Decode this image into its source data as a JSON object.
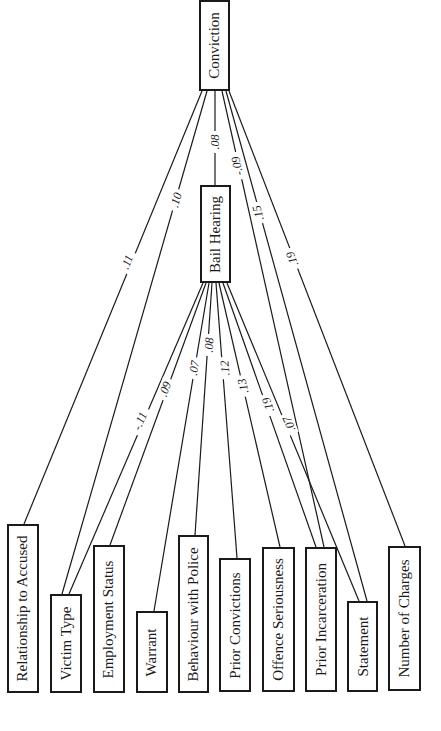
{
  "diagram": {
    "type": "path-diagram",
    "orientation": "rotated-90",
    "nodes": {
      "conviction": {
        "label": "Conviction",
        "x": 199,
        "y": 0,
        "w": 31,
        "h": 91
      },
      "bail_hearing": {
        "label": "Bail Hearing",
        "x": 200,
        "y": 185,
        "w": 31,
        "h": 98
      },
      "relationship": {
        "label": "Relationship to Accused",
        "x": 7,
        "y": 524,
        "w": 32,
        "h": 169
      },
      "victim_type": {
        "label": "Victim Type",
        "x": 50,
        "y": 594,
        "w": 32,
        "h": 99
      },
      "employment": {
        "label": "Employment Status",
        "x": 93,
        "y": 545,
        "w": 32,
        "h": 148
      },
      "warrant": {
        "label": "Warrant",
        "x": 136,
        "y": 611,
        "w": 32,
        "h": 82
      },
      "behaviour": {
        "label": "Behaviour with Police",
        "x": 178,
        "y": 535,
        "w": 31,
        "h": 158
      },
      "prior_convictions": {
        "label": "Prior Convictions",
        "x": 219,
        "y": 558,
        "w": 32,
        "h": 134
      },
      "offence": {
        "label": "Offence Seriousness",
        "x": 262,
        "y": 547,
        "w": 33,
        "h": 145
      },
      "prior_incarceration": {
        "label": "Prior Incarceration",
        "x": 305,
        "y": 547,
        "w": 32,
        "h": 145
      },
      "statement": {
        "label": "Statement",
        "x": 347,
        "y": 601,
        "w": 31,
        "h": 91
      },
      "number_charges": {
        "label": "Number of Charges",
        "x": 388,
        "y": 546,
        "w": 33,
        "h": 145
      }
    },
    "edges": [
      {
        "from": "conviction",
        "to": "relationship",
        "coef": ".11",
        "x1": 202,
        "y1": 91,
        "x2": 24,
        "y2": 524,
        "lx": 127,
        "ly": 262
      },
      {
        "from": "conviction",
        "to": "victim_type",
        "coef": ".10",
        "x1": 207,
        "y1": 91,
        "x2": 62,
        "y2": 594,
        "lx": 176,
        "ly": 200
      },
      {
        "from": "conviction",
        "to": "bail_hearing",
        "coef": ".08",
        "x1": 215,
        "y1": 91,
        "x2": 215,
        "y2": 185,
        "lx": 215,
        "ly": 142
      },
      {
        "from": "conviction",
        "to": "prior_incarceration",
        "coef": "-.09",
        "x1": 222,
        "y1": 91,
        "x2": 324,
        "y2": 547,
        "lx": 237,
        "ly": 166
      },
      {
        "from": "conviction",
        "to": "statement",
        "coef": ".15",
        "x1": 226,
        "y1": 91,
        "x2": 367,
        "y2": 601,
        "lx": 258,
        "ly": 213
      },
      {
        "from": "conviction",
        "to": "number_charges",
        "coef": ".19",
        "x1": 229,
        "y1": 91,
        "x2": 405,
        "y2": 546,
        "lx": 292,
        "ly": 259
      },
      {
        "from": "bail_hearing",
        "to": "victim_type",
        "coef": "-.11",
        "x1": 203,
        "y1": 283,
        "x2": 69,
        "y2": 594,
        "lx": 140,
        "ly": 421
      },
      {
        "from": "bail_hearing",
        "to": "employment",
        "coef": ".09",
        "x1": 206,
        "y1": 283,
        "x2": 110,
        "y2": 545,
        "lx": 165,
        "ly": 389
      },
      {
        "from": "bail_hearing",
        "to": "warrant",
        "coef": ".07",
        "x1": 209,
        "y1": 283,
        "x2": 154,
        "y2": 611,
        "lx": 194,
        "ly": 368
      },
      {
        "from": "bail_hearing",
        "to": "behaviour",
        "coef": ".08",
        "x1": 212,
        "y1": 283,
        "x2": 195,
        "y2": 535,
        "lx": 209,
        "ly": 345
      },
      {
        "from": "bail_hearing",
        "to": "prior_convictions",
        "coef": ".12",
        "x1": 216,
        "y1": 283,
        "x2": 237,
        "y2": 558,
        "lx": 225,
        "ly": 368
      },
      {
        "from": "bail_hearing",
        "to": "offence",
        "coef": ".13",
        "x1": 219,
        "y1": 283,
        "x2": 280,
        "y2": 547,
        "lx": 243,
        "ly": 386
      },
      {
        "from": "bail_hearing",
        "to": "prior_incarceration",
        "coef": ".19",
        "x1": 223,
        "y1": 283,
        "x2": 316,
        "y2": 547,
        "lx": 268,
        "ly": 405
      },
      {
        "from": "bail_hearing",
        "to": "statement",
        "coef": ".07",
        "x1": 227,
        "y1": 283,
        "x2": 359,
        "y2": 601,
        "lx": 289,
        "ly": 424
      }
    ]
  }
}
